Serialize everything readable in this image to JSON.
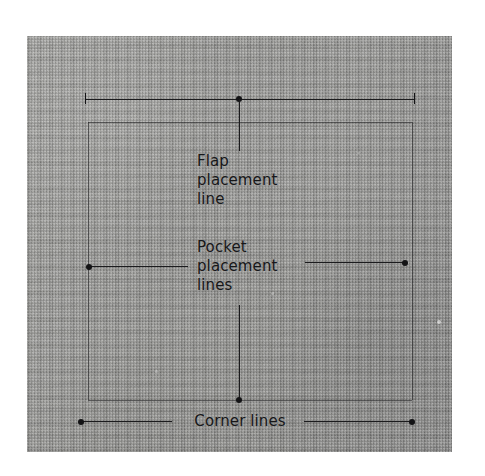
{
  "figure": {
    "fabric_color": "#9b9b98",
    "ink_color": "#171719",
    "background_color": "#ffffff"
  },
  "annotations": {
    "flap": {
      "label": "Flap\nplacement\nline",
      "leader": "vertical-from-top-line"
    },
    "pocket": {
      "label": "Pocket\nplacement\nlines",
      "leader": "horizontal-both-sides"
    },
    "corner": {
      "label": "Corner lines",
      "leader": "horizontal-both-sides"
    }
  },
  "markings": {
    "flap_placement_line": {
      "y": 99,
      "x1": 85,
      "x2": 414,
      "terminators": "tick-tick"
    },
    "pocket_placement_line_left": {
      "y": 266,
      "x1": 88,
      "x2": 188,
      "terminators": "dot-left"
    },
    "pocket_placement_line_right": {
      "y": 262,
      "x1": 305,
      "x2": 405,
      "terminators": "dot-right"
    },
    "corner_line": {
      "y": 421,
      "x1": 80,
      "x2": 412,
      "terminators": "dot-dot"
    },
    "pocket_rectangle": {
      "left": 88,
      "top": 122,
      "right": 412,
      "bottom": 400
    }
  }
}
